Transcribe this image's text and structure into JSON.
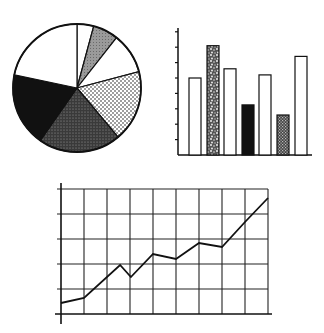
{
  "chart_data": [
    {
      "type": "pie",
      "title": "",
      "center": [
        77,
        88
      ],
      "radius": 64,
      "slices": [
        {
          "label": "",
          "value": 4.2,
          "fill": "white"
        },
        {
          "label": "",
          "value": 6.4,
          "fill": "gray"
        },
        {
          "label": "",
          "value": 10.3,
          "fill": "white"
        },
        {
          "label": "",
          "value": 18.0,
          "fill": "light-dots"
        },
        {
          "label": "",
          "value": 20.8,
          "fill": "dark-stipple"
        },
        {
          "label": "",
          "value": 18.6,
          "fill": "black"
        },
        {
          "label": "",
          "value": 21.7,
          "fill": "white"
        }
      ]
    },
    {
      "type": "bar",
      "title": "",
      "xlabel": "",
      "ylabel": "",
      "ylim": [
        0,
        8
      ],
      "ticks": 8,
      "categories": [
        "1",
        "2",
        "3",
        "4",
        "5",
        "6",
        "7"
      ],
      "values": [
        5.0,
        7.1,
        5.6,
        3.25,
        5.2,
        2.6,
        6.4
      ],
      "fills": [
        "white",
        "speckle",
        "white",
        "black",
        "white",
        "crosshatch",
        "white"
      ]
    },
    {
      "type": "line",
      "title": "",
      "xlabel": "",
      "ylabel": "",
      "grid": true,
      "xlim": [
        0,
        9
      ],
      "ylim": [
        0,
        5
      ],
      "x": [
        0,
        1,
        2.57,
        3.04,
        4,
        5,
        6,
        7,
        8,
        9
      ],
      "y": [
        0.44,
        0.64,
        1.96,
        1.48,
        2.4,
        2.2,
        2.84,
        2.68,
        3.68,
        4.64
      ]
    }
  ]
}
